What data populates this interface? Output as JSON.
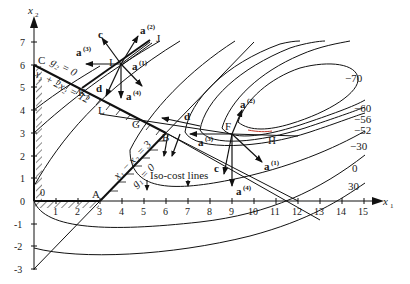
{
  "figure": {
    "x_axis_label": "x",
    "x_axis_sub": "1",
    "y_axis_label": "x",
    "y_axis_sub": "2",
    "x_ticks": [
      "1",
      "2",
      "3",
      "4",
      "5",
      "6",
      "7",
      "8",
      "9",
      "10",
      "11",
      "12",
      "13",
      "14",
      "15"
    ],
    "y_ticks": [
      "-3",
      "-2",
      "-1",
      "0",
      "1",
      "2",
      "3",
      "4",
      "5",
      "6",
      "7"
    ],
    "origin_label": "0",
    "points": {
      "A": "A",
      "B": "B",
      "C": "C",
      "F": "F",
      "G": "G",
      "H": "H",
      "I": "I",
      "J": "J",
      "K": "K",
      "L": "L"
    },
    "constraints": {
      "g2_label": "g₂ = 0",
      "g2_eq": "x₁ + 2x₂ = 12",
      "g1_label": "g₁ = 0",
      "g1_eq": "x₁ − x₂ = 3"
    },
    "vectors": {
      "c": "c",
      "d": "d",
      "a": "a",
      "sup1": "(1)",
      "sup2": "(2)",
      "sup3": "(3)",
      "sup4": "(4)"
    },
    "annotation": "Iso-cost lines",
    "contour_levels": [
      "−70",
      "−60",
      "−56",
      "−52",
      "−30",
      "0",
      "30"
    ]
  }
}
